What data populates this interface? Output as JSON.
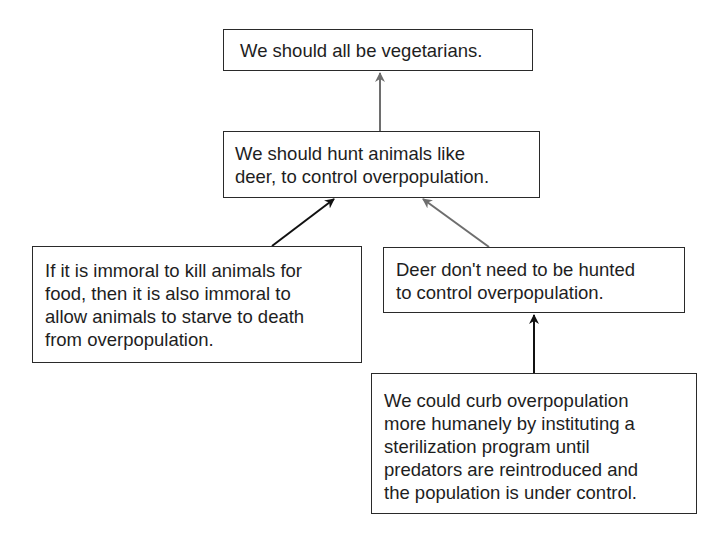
{
  "diagram": {
    "type": "argument-map",
    "colors": {
      "border": "#2a2a2a",
      "arrow_gray": "#6e6e6e",
      "arrow_black": "#111111",
      "text": "#1e1e1e"
    },
    "nodes": [
      {
        "id": "conclusion",
        "lines": [
          "We should all be vegetarians."
        ]
      },
      {
        "id": "objection",
        "lines": [
          "We should hunt animals like",
          "deer, to control overpopulation."
        ]
      },
      {
        "id": "support-objection",
        "lines": [
          "If it is immoral to kill animals for",
          "food, then it is also immoral to",
          "allow animals to starve to death",
          "from overpopulation."
        ]
      },
      {
        "id": "rebuttal",
        "lines": [
          "Deer don't need to be hunted",
          "to control overpopulation."
        ]
      },
      {
        "id": "support-rebuttal",
        "lines": [
          "We could curb overpopulation",
          "more humanely by instituting a",
          "sterilization program until",
          "predators are reintroduced and",
          "the population is under control."
        ]
      }
    ],
    "edges": [
      {
        "from": "objection",
        "to": "conclusion",
        "color": "gray"
      },
      {
        "from": "support-objection",
        "to": "objection",
        "color": "black"
      },
      {
        "from": "rebuttal",
        "to": "objection",
        "color": "gray"
      },
      {
        "from": "support-rebuttal",
        "to": "rebuttal",
        "color": "black"
      }
    ]
  }
}
